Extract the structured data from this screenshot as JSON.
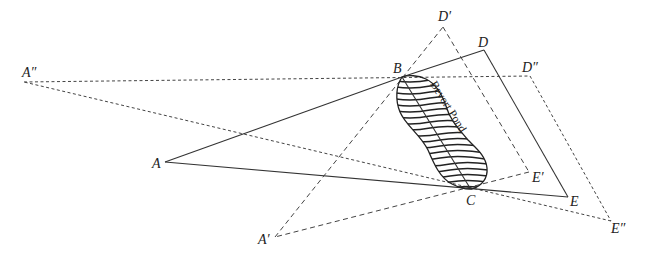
{
  "diagram": {
    "title": "",
    "pond_label": "Bevort Pond",
    "points": {
      "A": {
        "label": "A",
        "x": 165,
        "y": 162
      },
      "A1": {
        "label": "A′",
        "x": 275,
        "y": 237
      },
      "A2": {
        "label": "A″",
        "x": 24,
        "y": 82
      },
      "B": {
        "label": "B",
        "x": 402,
        "y": 77
      },
      "C": {
        "label": "C",
        "x": 470,
        "y": 188
      },
      "D": {
        "label": "D",
        "x": 484,
        "y": 50
      },
      "D1": {
        "label": "D′",
        "x": 443,
        "y": 27
      },
      "D2": {
        "label": "D″",
        "x": 530,
        "y": 76
      },
      "E": {
        "label": "E",
        "x": 568,
        "y": 197
      },
      "E1": {
        "label": "E′",
        "x": 529,
        "y": 172
      },
      "E2": {
        "label": "E″",
        "x": 611,
        "y": 221
      }
    },
    "lines": [
      {
        "from": "A",
        "to": "B",
        "style": "solid"
      },
      {
        "from": "B",
        "to": "D",
        "style": "solid"
      },
      {
        "from": "D",
        "to": "E",
        "style": "solid"
      },
      {
        "from": "E",
        "to": "A",
        "style": "solid"
      },
      {
        "from": "A1",
        "to": "D1",
        "style": "dashed"
      },
      {
        "from": "D1",
        "to": "E1",
        "style": "dashed"
      },
      {
        "from": "E1",
        "to": "A1",
        "style": "dashed"
      },
      {
        "from": "A2",
        "to": "D2",
        "style": "dotted"
      },
      {
        "from": "D2",
        "to": "E2",
        "style": "dotted"
      },
      {
        "from": "E2",
        "to": "A2",
        "style": "dotted"
      },
      {
        "from": "B",
        "to": "C",
        "style": "solid"
      }
    ]
  }
}
